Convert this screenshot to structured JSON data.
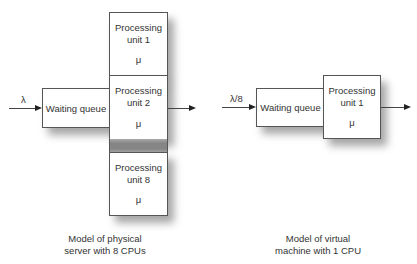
{
  "physical": {
    "input_label": "λ",
    "queue_label": "Waiting queue",
    "units": [
      {
        "title": "Processing",
        "name": "unit 1",
        "rate": "μ"
      },
      {
        "title": "Processing",
        "name": "unit 2",
        "rate": "μ"
      },
      {
        "title": "Processing",
        "name": "unit 8",
        "rate": "μ"
      }
    ],
    "caption_line1": "Model of physical",
    "caption_line2": "server with 8 CPUs"
  },
  "virtual": {
    "input_label": "λ/8",
    "queue_label": "Waiting queue",
    "unit": {
      "title": "Processing",
      "name": "unit 1",
      "rate": "μ"
    },
    "caption_line1": "Model of virtual",
    "caption_line2": "machine with 1 CPU"
  }
}
